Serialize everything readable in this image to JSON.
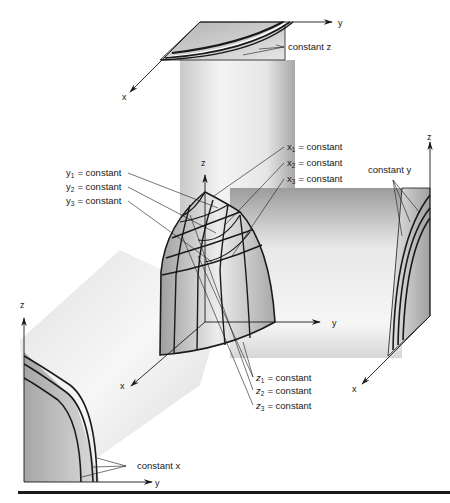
{
  "figure": {
    "type": "3d-coordinate-surface-projection-diagram",
    "colors": {
      "ink": "#1a1a1a",
      "shade_dark": "#9a9a9a",
      "shade_light": "#f2f2f2",
      "background": "#ffffff"
    }
  },
  "top_panel": {
    "axis_y": "y",
    "axis_x": "x",
    "callout": "constant z"
  },
  "center_solid": {
    "axis_z": "z",
    "axis_y": "y",
    "axis_x": "x",
    "y_labels": [
      {
        "var": "y",
        "sub": "1",
        "text": "= constant"
      },
      {
        "var": "y",
        "sub": "2",
        "text": "= constant"
      },
      {
        "var": "y",
        "sub": "3",
        "text": "= constant"
      }
    ],
    "x_labels": [
      {
        "var": "x",
        "sub": "1",
        "text": "= constant"
      },
      {
        "var": "x",
        "sub": "2",
        "text": "= constant"
      },
      {
        "var": "x",
        "sub": "3",
        "text": "= constant"
      }
    ],
    "z_labels": [
      {
        "var": "z",
        "sub": "1",
        "text": "= constant"
      },
      {
        "var": "z",
        "sub": "2",
        "text": "= constant"
      },
      {
        "var": "z",
        "sub": "3",
        "text": "= constant"
      }
    ]
  },
  "right_panel": {
    "axis_z": "z",
    "axis_x": "x",
    "callout": "constant y"
  },
  "left_panel": {
    "axis_z": "z",
    "axis_y": "y",
    "callout": "constant x"
  }
}
